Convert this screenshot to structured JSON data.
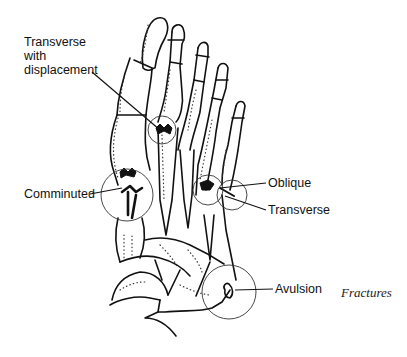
{
  "diagram": {
    "caption": "Fractures",
    "labels": [
      {
        "id": "transverse-displacement",
        "lines": [
          "Transverse",
          "with",
          "displacement"
        ]
      },
      {
        "id": "comminuted",
        "text": "Comminuted"
      },
      {
        "id": "oblique",
        "text": "Oblique"
      },
      {
        "id": "transverse",
        "text": "Transverse"
      },
      {
        "id": "avulsion",
        "text": "Avulsion"
      }
    ]
  }
}
